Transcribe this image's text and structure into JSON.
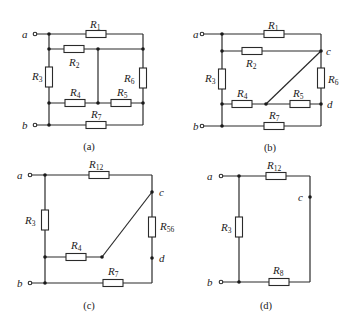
{
  "figure": {
    "panels": [
      {
        "id": "a",
        "caption": "(a)",
        "terminals": [
          "a",
          "b"
        ],
        "nodes": [],
        "resistors": [
          {
            "name": "R",
            "sub": "1"
          },
          {
            "name": "R",
            "sub": "2"
          },
          {
            "name": "R",
            "sub": "3"
          },
          {
            "name": "R",
            "sub": "4"
          },
          {
            "name": "R",
            "sub": "5"
          },
          {
            "name": "R",
            "sub": "6"
          },
          {
            "name": "R",
            "sub": "7"
          }
        ]
      },
      {
        "id": "b",
        "caption": "(b)",
        "terminals": [
          "a",
          "b"
        ],
        "nodes": [
          "c",
          "d"
        ],
        "resistors": [
          {
            "name": "R",
            "sub": "1"
          },
          {
            "name": "R",
            "sub": "2"
          },
          {
            "name": "R",
            "sub": "3"
          },
          {
            "name": "R",
            "sub": "4"
          },
          {
            "name": "R",
            "sub": "5"
          },
          {
            "name": "R",
            "sub": "6"
          },
          {
            "name": "R",
            "sub": "7"
          }
        ]
      },
      {
        "id": "c",
        "caption": "(c)",
        "terminals": [
          "a",
          "b"
        ],
        "nodes": [
          "c",
          "d"
        ],
        "resistors": [
          {
            "name": "R",
            "sub": "12"
          },
          {
            "name": "R",
            "sub": "3"
          },
          {
            "name": "R",
            "sub": "4"
          },
          {
            "name": "R",
            "sub": "56"
          },
          {
            "name": "R",
            "sub": "7"
          }
        ]
      },
      {
        "id": "d",
        "caption": "(d)",
        "terminals": [
          "a",
          "b"
        ],
        "nodes": [
          "c"
        ],
        "resistors": [
          {
            "name": "R",
            "sub": "12"
          },
          {
            "name": "R",
            "sub": "3"
          },
          {
            "name": "R",
            "sub": "8"
          }
        ]
      }
    ]
  }
}
